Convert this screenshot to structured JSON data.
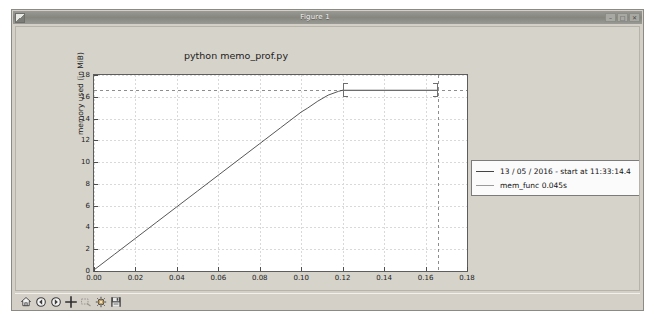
{
  "window": {
    "title": "Figure 1",
    "icon": "app-icon",
    "buttons": [
      {
        "name": "minimize",
        "glyph": "–"
      },
      {
        "name": "maximize",
        "glyph": "□"
      },
      {
        "name": "close",
        "glyph": "✕"
      }
    ]
  },
  "toolbar": {
    "items": [
      {
        "name": "home-icon",
        "label": "Home",
        "enabled": true
      },
      {
        "name": "back-arrow-icon",
        "label": "Back",
        "enabled": true
      },
      {
        "name": "forward-arrow-icon",
        "label": "Forward",
        "enabled": true
      },
      {
        "name": "pan-icon",
        "label": "Pan",
        "enabled": true
      },
      {
        "name": "zoom-rect-icon",
        "label": "Zoom to rectangle",
        "enabled": false
      },
      {
        "name": "configure-subplots-icon",
        "label": "Configure subplots",
        "enabled": true
      },
      {
        "name": "save-icon",
        "label": "Save figure",
        "enabled": true
      }
    ]
  },
  "chart_data": {
    "type": "line",
    "title": "python memo_prof.py",
    "xlabel": "time (in seconds)",
    "ylabel": "memory used (in MiB)",
    "xlim": [
      0.0,
      0.18
    ],
    "ylim": [
      0,
      18
    ],
    "xticks": [
      "0.00",
      "0.02",
      "0.04",
      "0.06",
      "0.08",
      "0.10",
      "0.12",
      "0.14",
      "0.16",
      "0.18"
    ],
    "xtick_values": [
      0.0,
      0.02,
      0.04,
      0.06,
      0.08,
      0.1,
      0.12,
      0.14,
      0.16,
      0.18
    ],
    "yticks": [
      "0",
      "2",
      "4",
      "6",
      "8",
      "10",
      "12",
      "14",
      "16",
      "18"
    ],
    "ytick_values": [
      0,
      2,
      4,
      6,
      8,
      10,
      12,
      14,
      16,
      18
    ],
    "grid": true,
    "legend_position": "right-outside",
    "series": [
      {
        "name": "13 / 05 / 2016 - start at 11:33:14.4",
        "color": "#444444",
        "x": [
          0.0,
          0.01,
          0.02,
          0.03,
          0.04,
          0.05,
          0.06,
          0.07,
          0.08,
          0.09,
          0.1,
          0.103,
          0.108,
          0.113,
          0.118,
          0.12,
          0.135,
          0.15,
          0.166
        ],
        "y": [
          0.1,
          1.55,
          3.0,
          4.45,
          5.9,
          7.35,
          8.8,
          10.25,
          11.7,
          13.15,
          14.6,
          14.95,
          15.6,
          16.15,
          16.5,
          16.6,
          16.6,
          16.6,
          16.6
        ]
      }
    ],
    "annotations": [
      {
        "name": "mem-func-bracket",
        "label": "mem_func 0.045s",
        "color": "#9a9a9a",
        "x_start": 0.12,
        "x_end": 0.166,
        "y": 16.6
      },
      {
        "name": "peak-memory-dashed-hline",
        "orientation": "horizontal",
        "y": 16.6
      },
      {
        "name": "end-time-dashed-vline",
        "orientation": "vertical",
        "x": 0.166
      }
    ],
    "legend": [
      {
        "name": "run-timestamp",
        "label": "13 / 05 / 2016 - start at 11:33:14.4",
        "swatch": "dark"
      },
      {
        "name": "mem-func-duration",
        "label": "mem_func 0.045s",
        "swatch": "grey"
      }
    ]
  }
}
